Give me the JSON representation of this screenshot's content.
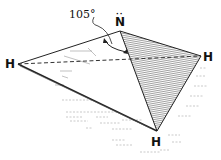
{
  "diagram": {
    "central_atom": {
      "symbol": "N",
      "lone_pair": "··"
    },
    "atoms": [
      {
        "id": "h_left",
        "symbol": "H"
      },
      {
        "id": "h_right",
        "symbol": "H"
      },
      {
        "id": "h_bottom",
        "symbol": "H"
      }
    ],
    "bond_angle": {
      "label": "105°"
    },
    "colors": {
      "line": "#222222",
      "shade": "#555555",
      "background": "#ffffff"
    }
  }
}
